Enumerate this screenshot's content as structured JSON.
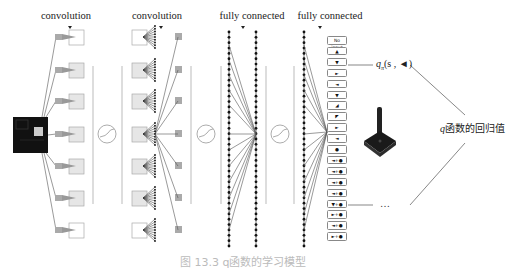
{
  "layers": [
    {
      "label": "convolution",
      "x": 66
    },
    {
      "label": "convolution",
      "x": 157
    },
    {
      "label": "fully connected",
      "x": 252
    },
    {
      "label": "fully connected",
      "x": 330
    }
  ],
  "actions": {
    "first_box": "No input",
    "symbols": [
      "▲",
      "▼",
      "►",
      "◄",
      "▼",
      "◢",
      "◤",
      "►",
      "◄",
      "●",
      "◄+●",
      "◄+●",
      "◄+●",
      "◄+●",
      "▼+●",
      "►+●",
      "◄+●",
      "►+●"
    ]
  },
  "output": {
    "q_label": "q",
    "q_subscript": "π",
    "q_args": "(s , ◄)",
    "ellipsis": "…",
    "regression_label_prefix": "q",
    "regression_label": "函数的回归值"
  },
  "caption": "图 13.3  q函数的学习模型",
  "colors": {
    "line": "#555555",
    "dot": "#111111",
    "box_border": "#888888",
    "kernel": "#999999",
    "input_frame": "#111111",
    "separator": "#aaaaaa"
  }
}
